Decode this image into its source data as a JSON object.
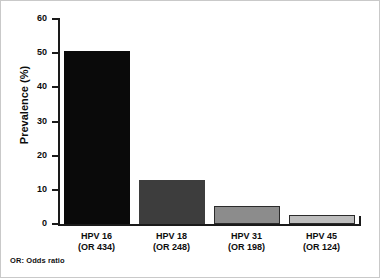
{
  "chart_data": {
    "type": "bar",
    "title": "",
    "subtitle": "",
    "xlabel": "",
    "ylabel": "Prevalence (%)",
    "ylim": [
      0,
      60
    ],
    "yticks": [
      0,
      10,
      20,
      30,
      40,
      50,
      60
    ],
    "ytick_labels": [
      "0",
      "10",
      "20",
      "30",
      "40",
      "50",
      "60"
    ],
    "grid": false,
    "legend": "none",
    "categories": [
      "HPV 16\n(OR 434)",
      "HPV 18\n(OR 248)",
      "HPV 31\n(OR 198)",
      "HPV 45\n(OR 124)"
    ],
    "category_lines": [
      {
        "name": "HPV 16",
        "odds_ratio": "(OR 434)"
      },
      {
        "name": "HPV 18",
        "odds_ratio": "(OR 248)"
      },
      {
        "name": "HPV 31",
        "odds_ratio": "(OR 198)"
      },
      {
        "name": "HPV 45",
        "odds_ratio": "(OR 124)"
      }
    ],
    "values": [
      50.5,
      12.8,
      5.3,
      2.7
    ],
    "bar_colors": [
      "#0a0a0a",
      "#3d3d3d",
      "#8c8c8c",
      "#bdbdbd"
    ],
    "annotations": [
      "OR: Odds ratio"
    ]
  },
  "footnote": "OR: Odds ratio",
  "axis": {
    "y_title": "Prevalence (%)"
  }
}
